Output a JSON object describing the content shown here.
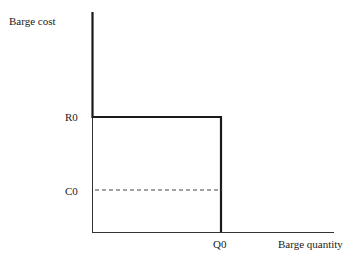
{
  "diagram": {
    "y_axis_label": "Barge cost",
    "x_axis_label": "Barge quantity",
    "ticks": {
      "r0": "R0",
      "c0": "C0",
      "q0": "Q0"
    },
    "lines": {
      "supply_curve": "thick L-shaped curve: vertical at origin up to top, horizontal at R0 to Q0, vertical down at Q0",
      "cost_line": "dashed horizontal line at C0 from axis to Q0"
    },
    "colors": {
      "line": "#1a1a1a",
      "axis": "#333333",
      "dashed": "#444444"
    }
  }
}
